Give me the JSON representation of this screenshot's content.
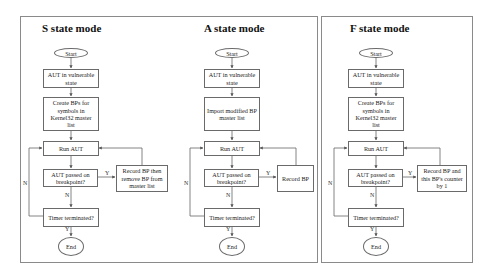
{
  "diagrams": [
    {
      "title": "S state mode",
      "start": "Start",
      "step1": "AUT in vulnerable state",
      "step2": "Create BPs for symbols in Kernel32 master list",
      "run": "Run AUT",
      "decision": "AUT passed on breakpoint?",
      "action": "Record BP then remove BP from master list",
      "timer": "Timer terminated?",
      "end": "End",
      "labels": {
        "yes_action": "Y",
        "no_timer": "N",
        "no_loop": "N",
        "yes_end": "Y"
      }
    },
    {
      "title": "A state mode",
      "start": "Start",
      "step1": "AUT in vulnerable state",
      "step2": "Import modified BP master list",
      "run": "Run AUT",
      "decision": "AUT passed on breakpoint?",
      "action": "Record BP",
      "timer": "Timer terminated?",
      "end": "End",
      "labels": {
        "yes_action": "Y",
        "no_timer": "N",
        "no_loop": "N",
        "yes_end": "Y"
      }
    },
    {
      "title": "F state mode",
      "start": "Start",
      "step1": "AUT in vulnerable state",
      "step2": "Create BPs for symbols in Kernel32 master list",
      "run": "Run AUT",
      "decision": "AUT passed on breakpoint?",
      "action": "Record BP and this BP's counter by 1",
      "timer": "Timer terminated?",
      "end": "End",
      "labels": {
        "yes_action": "Y",
        "no_timer": "N",
        "no_loop": "N",
        "yes_end": "Y"
      }
    }
  ]
}
